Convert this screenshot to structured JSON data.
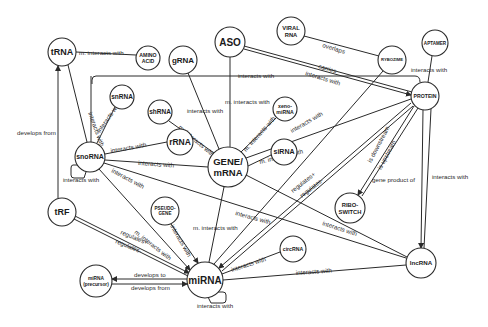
{
  "diagram": {
    "type": "ncRNA interaction network",
    "nodes": [
      {
        "id": "trna",
        "label": "tRNA",
        "x": 62,
        "y": 52,
        "r": 14,
        "fs": 9
      },
      {
        "id": "amino",
        "label": "AMINO",
        "label2": "ACID",
        "x": 148,
        "y": 58,
        "r": 12,
        "fs": 5.2
      },
      {
        "id": "grna",
        "label": "gRNA",
        "x": 183,
        "y": 60,
        "r": 14,
        "fs": 8
      },
      {
        "id": "aso",
        "label": "ASO",
        "x": 230,
        "y": 42,
        "r": 15,
        "fs": 10
      },
      {
        "id": "viral",
        "label": "VIRAL",
        "label2": "RNA",
        "x": 291,
        "y": 31,
        "r": 14,
        "fs": 5.8
      },
      {
        "id": "ribozyme",
        "label": "RYBOZIME",
        "x": 392,
        "y": 60,
        "r": 14,
        "fs": 4.2
      },
      {
        "id": "aptamer",
        "label": "APTAMER",
        "x": 435,
        "y": 43,
        "r": 13,
        "fs": 4.6
      },
      {
        "id": "protein",
        "label": "PROTEIN",
        "x": 425,
        "y": 96,
        "r": 14,
        "fs": 5.2
      },
      {
        "id": "snrna",
        "label": "snRNA",
        "x": 122,
        "y": 97,
        "r": 12,
        "fs": 6.5
      },
      {
        "id": "shrna",
        "label": "shRNA",
        "x": 160,
        "y": 112,
        "r": 12,
        "fs": 6.5
      },
      {
        "id": "xeno",
        "label": "xeno-",
        "label2": "miRNA",
        "x": 285,
        "y": 109,
        "r": 12,
        "fs": 5.2
      },
      {
        "id": "rrna",
        "label": "rRNA",
        "x": 180,
        "y": 142,
        "r": 13,
        "fs": 8.5
      },
      {
        "id": "snorna",
        "label": "snoRNA",
        "x": 90,
        "y": 157,
        "r": 15,
        "fs": 7
      },
      {
        "id": "genemrna",
        "label": "GENE/",
        "label2": "mRNA",
        "x": 228,
        "y": 167,
        "r": 20,
        "fs": 9.5
      },
      {
        "id": "sirna",
        "label": "siRNA",
        "x": 284,
        "y": 152,
        "r": 13,
        "fs": 7
      },
      {
        "id": "pseudo",
        "label": "PSEUDO-",
        "label2": "GENE",
        "x": 165,
        "y": 211,
        "r": 14,
        "fs": 4.6
      },
      {
        "id": "riboswitch",
        "label": "RIBO-",
        "label2": "SWITCH",
        "x": 350,
        "y": 208,
        "r": 15,
        "fs": 5.8
      },
      {
        "id": "trf",
        "label": "tRF",
        "x": 62,
        "y": 212,
        "r": 14,
        "fs": 9
      },
      {
        "id": "circrna",
        "label": "circRNA",
        "x": 293,
        "y": 249,
        "r": 13,
        "fs": 5.2
      },
      {
        "id": "lncrna",
        "label": "lncRNA",
        "x": 421,
        "y": 263,
        "r": 15,
        "fs": 6.2
      },
      {
        "id": "mirna_pre",
        "label": "miRNA",
        "label2": "(precursor)",
        "x": 96,
        "y": 281,
        "r": 16,
        "fs": 4.8
      },
      {
        "id": "mirna",
        "label": "miRNA",
        "x": 205,
        "y": 280,
        "r": 18,
        "fs": 10
      }
    ],
    "edge_labels": [
      {
        "text": "m. interacts with",
        "x": 79,
        "y": 55,
        "rot": 0
      },
      {
        "text": "interacts with",
        "x": 238,
        "y": 78,
        "rot": 0
      },
      {
        "text": "overlaps",
        "x": 322,
        "y": 47,
        "rot": 17
      },
      {
        "text": "carries",
        "x": 318,
        "y": 68,
        "rot": 17
      },
      {
        "text": "interacts with",
        "x": 305,
        "y": 75,
        "rot": 17
      },
      {
        "text": "interacts with",
        "x": 411,
        "y": 72,
        "rot": 0
      },
      {
        "text": "m. interacts with",
        "x": 225,
        "y": 104,
        "rot": 0
      },
      {
        "text": "interacts with",
        "x": 187,
        "y": 113,
        "rot": 0
      },
      {
        "text": "interacts with",
        "x": 88,
        "y": 113,
        "rot": 70
      },
      {
        "text": "interacts with",
        "x": 100,
        "y": 133,
        "rot": -55
      },
      {
        "text": "develops from",
        "x": 17,
        "y": 135,
        "rot": 0
      },
      {
        "text": "interacts with",
        "x": 111,
        "y": 153,
        "rot": -10
      },
      {
        "text": "interacts with",
        "x": 138,
        "y": 165,
        "rot": 4
      },
      {
        "text": "interacts with",
        "x": 63,
        "y": 182,
        "rot": 0
      },
      {
        "text": "interacts with",
        "x": 111,
        "y": 172,
        "rot": 28
      },
      {
        "text": "m. interacts with",
        "x": 260,
        "y": 164,
        "rot": -14
      },
      {
        "text": "m. interacts with",
        "x": 246,
        "y": 152,
        "rot": -48
      },
      {
        "text": "interacts with",
        "x": 292,
        "y": 133,
        "rot": -30
      },
      {
        "text": "m. interacts with",
        "x": 178,
        "y": 128,
        "rot": 40
      },
      {
        "text": "regulates+",
        "x": 293,
        "y": 193,
        "rot": -38
      },
      {
        "text": "regulates-",
        "x": 302,
        "y": 198,
        "rot": -38
      },
      {
        "text": "is downstream",
        "x": 371,
        "y": 163,
        "rot": -62
      },
      {
        "text": "is upstream",
        "x": 381,
        "y": 170,
        "rot": -62
      },
      {
        "text": "gene product of",
        "x": 372,
        "y": 182,
        "rot": 0
      },
      {
        "text": "interacts with",
        "x": 432,
        "y": 179,
        "rot": 0
      },
      {
        "text": "interacts with",
        "x": 235,
        "y": 215,
        "rot": 15
      },
      {
        "text": "interacts with",
        "x": 322,
        "y": 225,
        "rot": 18
      },
      {
        "text": "m. interacts with",
        "x": 193,
        "y": 230,
        "rot": 0
      },
      {
        "text": "interacts with",
        "x": 170,
        "y": 226,
        "rot": 60
      },
      {
        "text": "m. interacts with",
        "x": 134,
        "y": 233,
        "rot": 38
      },
      {
        "text": "regulates+",
        "x": 120,
        "y": 234,
        "rot": 22
      },
      {
        "text": "regulates-",
        "x": 115,
        "y": 243,
        "rot": 22
      },
      {
        "text": "develops to",
        "x": 134,
        "y": 277,
        "rot": 0
      },
      {
        "text": "develops from",
        "x": 131,
        "y": 290,
        "rot": 0
      },
      {
        "text": "interacts with",
        "x": 232,
        "y": 272,
        "rot": -18
      },
      {
        "text": "interacts with",
        "x": 296,
        "y": 275,
        "rot": -4
      },
      {
        "text": "interacts with",
        "x": 197,
        "y": 308,
        "rot": 0
      }
    ]
  }
}
